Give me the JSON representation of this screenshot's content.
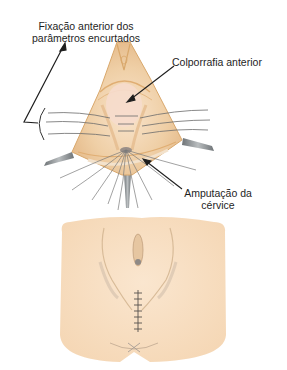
{
  "figure": {
    "title": "",
    "top_panel": "Surgical view – anterior colporrhaphy with cervical amputation",
    "bottom_panel": "Postoperative perineum with sutured incision"
  },
  "labels": {
    "fixation": {
      "line1": "Fixação anterior dos",
      "line2": "parâmetros encurtados"
    },
    "colporrhaphy": "Colporrafia anterior",
    "amputation": {
      "line1": "Amputação da",
      "line2": "cérvice"
    }
  },
  "colors": {
    "background": "#ffffff",
    "tissue_light": "#f6dcbc",
    "tissue_mid": "#e9c495",
    "tissue_outline": "#d9a86c",
    "skin": "#f8dfc3",
    "suture": "#6b6b6b",
    "retractor": "#8f9497",
    "text": "#1e1e1e",
    "arrow": "#1e1e1e"
  }
}
